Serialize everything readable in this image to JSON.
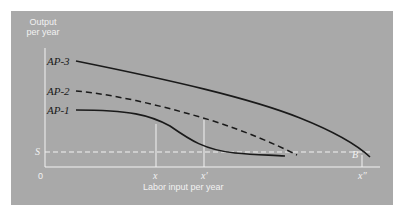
{
  "diagram": {
    "y_axis_label_line1": "Output",
    "y_axis_label_line2": "per year",
    "x_axis_label": "Labor input per year",
    "origin_label": "0",
    "s_label": "S",
    "b_label": "B",
    "x_ticks": [
      {
        "label": "x",
        "x": 156
      },
      {
        "label": "x′",
        "x": 204
      },
      {
        "label": "x″",
        "x": 362
      }
    ],
    "curves": [
      {
        "name": "AP-3",
        "label": "AP-3",
        "style": "solid"
      },
      {
        "name": "AP-2",
        "label": "AP-2",
        "style": "dashed"
      },
      {
        "name": "AP-1",
        "label": "AP-1",
        "style": "solid"
      }
    ],
    "colors": {
      "panel": "#a9a9a9",
      "curve": "#1a1a1a",
      "axis": "#f2f2f2"
    }
  }
}
